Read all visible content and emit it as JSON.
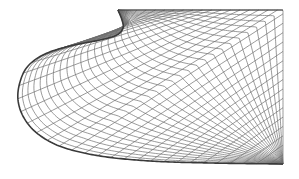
{
  "diagram": {
    "type": "curvilinear-structured-mesh",
    "width": 299,
    "height": 179,
    "background": "#ffffff",
    "mesh_line_color": "#6e6e6e",
    "boundary_line_color": "#3a3a3a",
    "mesh_line_width": 0.7,
    "boundary_line_width": 1.6,
    "grid_i_count": 28,
    "grid_j_count": 34,
    "left_boundary_points": [
      [
        118,
        10
      ],
      [
        122,
        20
      ],
      [
        123,
        28
      ],
      [
        117,
        35
      ],
      [
        100,
        40
      ],
      [
        70,
        46
      ],
      [
        45,
        54
      ],
      [
        28,
        66
      ],
      [
        20,
        82
      ],
      [
        18,
        100
      ],
      [
        24,
        118
      ],
      [
        38,
        134
      ],
      [
        62,
        147
      ],
      [
        100,
        156
      ],
      [
        150,
        161
      ],
      [
        210,
        163
      ],
      [
        283,
        164
      ]
    ],
    "top_edge": {
      "x1": 118,
      "y1": 10,
      "x2": 283,
      "y2": 10
    },
    "right_edge": {
      "x1": 283,
      "y1": 10,
      "x2": 283,
      "y2": 164
    }
  }
}
